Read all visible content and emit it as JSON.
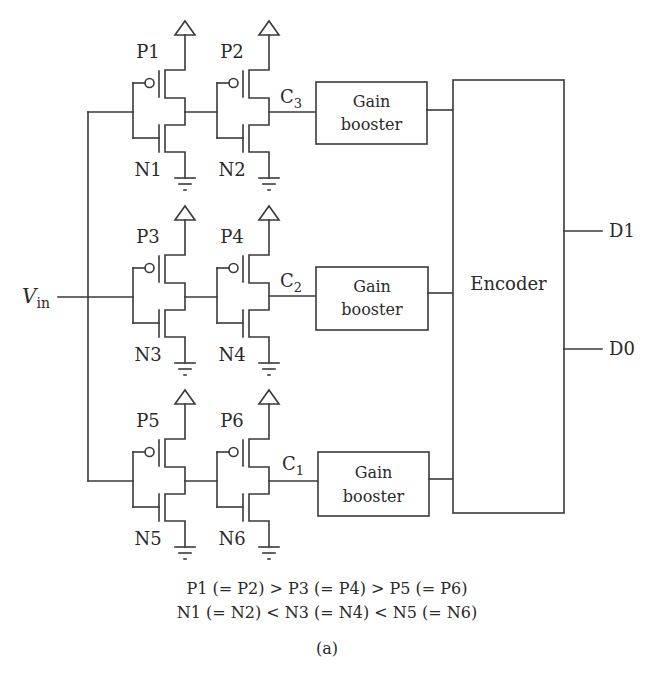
{
  "diagram": {
    "input_label": "V",
    "input_subscript": "in",
    "rows": [
      {
        "stage1": {
          "p_label": "P1",
          "n_label": "N1"
        },
        "stage2": {
          "p_label": "P2",
          "n_label": "N2"
        },
        "output_label": "C",
        "output_subscript": "3",
        "booster": {
          "line1": "Gain",
          "line2": "booster"
        }
      },
      {
        "stage1": {
          "p_label": "P3",
          "n_label": "N3"
        },
        "stage2": {
          "p_label": "P4",
          "n_label": "N4"
        },
        "output_label": "C",
        "output_subscript": "2",
        "booster": {
          "line1": "Gain",
          "line2": "booster"
        }
      },
      {
        "stage1": {
          "p_label": "P5",
          "n_label": "N5"
        },
        "stage2": {
          "p_label": "P6",
          "n_label": "N6"
        },
        "output_label": "C",
        "output_subscript": "1",
        "booster": {
          "line1": "Gain",
          "line2": "booster"
        }
      }
    ],
    "encoder": {
      "label": "Encoder"
    },
    "outputs": [
      {
        "label": "D1"
      },
      {
        "label": "D0"
      }
    ],
    "stroke_color": "#3a3a3a"
  },
  "caption": {
    "line1": "P1 (= P2) > P3 (= P4) > P5 (= P6)",
    "line2": "N1 (= N2) < N3 (= N4) < N5 (= N6)",
    "sublabel": "(a)"
  }
}
